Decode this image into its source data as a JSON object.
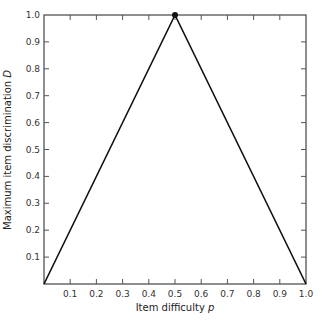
{
  "chart_data": {
    "type": "line",
    "title": "",
    "xlabel": "Item difficulty p",
    "xlabel_text": "Item difficulty ",
    "xlabel_var": "p",
    "ylabel": "Maximum item discrimination D",
    "ylabel_text": "Maximum item discrimination ",
    "ylabel_var": "D",
    "xlim": [
      0,
      1.0
    ],
    "ylim": [
      0,
      1.0
    ],
    "x_ticks": [
      "0.1",
      "0.2",
      "0.3",
      "0.4",
      "0.5",
      "0.6",
      "0.7",
      "0.8",
      "0.9",
      "1.0"
    ],
    "y_ticks": [
      "0.1",
      "0.2",
      "0.3",
      "0.4",
      "0.5",
      "0.6",
      "0.7",
      "0.8",
      "0.9",
      "1.0"
    ],
    "grid": false,
    "legend": null,
    "series": [
      {
        "name": "Maximum D",
        "x": [
          0.0,
          0.5,
          1.0
        ],
        "y": [
          0.0,
          1.0,
          0.0
        ]
      }
    ],
    "annotations": [
      {
        "type": "point",
        "x": 0.5,
        "y": 1.0,
        "marker": "filled-circle"
      }
    ]
  }
}
